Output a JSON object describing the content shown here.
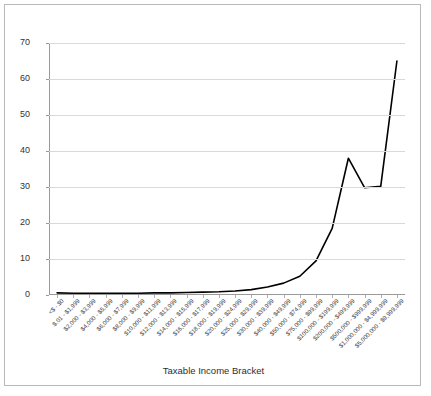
{
  "chart_data": {
    "type": "line",
    "title": "",
    "xlabel": "Taxable Income Bracket",
    "ylabel": "",
    "ylim": [
      0,
      70
    ],
    "yticks": [
      0,
      10,
      20,
      30,
      40,
      50,
      60,
      70
    ],
    "grid": true,
    "legend": "none",
    "line_color": "#000000",
    "categories": [
      "<$ - $0",
      "$.01 - $1,999",
      "$2,000 - $3,999",
      "$4,000 - $5,999",
      "$6,000 - $7,999",
      "$8,000 - $9,999",
      "$10,000 - $11,999",
      "$12,000 - $13,999",
      "$14,000 - $15,999",
      "$16,000 - $17,999",
      "$18,000 - $19,999",
      "$20,000 - $24,999",
      "$25,000 - $29,999",
      "$30,000 - $39,999",
      "$40,000 - $49,999",
      "$50,000 - $74,999",
      "$75,000 - $99,999",
      "$100,000 - $199,999",
      "$200,000 - $499,999",
      "$500,000 - $999,999",
      "$1,000,000 - $4,999,999",
      "$5,000,000 - $9,999,999"
    ],
    "values": [
      0.6,
      0.5,
      0.5,
      0.5,
      0.5,
      0.5,
      0.6,
      0.6,
      0.7,
      0.8,
      0.9,
      1.1,
      1.5,
      2.2,
      3.3,
      5.2,
      9.5,
      18.5,
      38.0,
      29.8,
      30.2,
      65.0
    ]
  }
}
